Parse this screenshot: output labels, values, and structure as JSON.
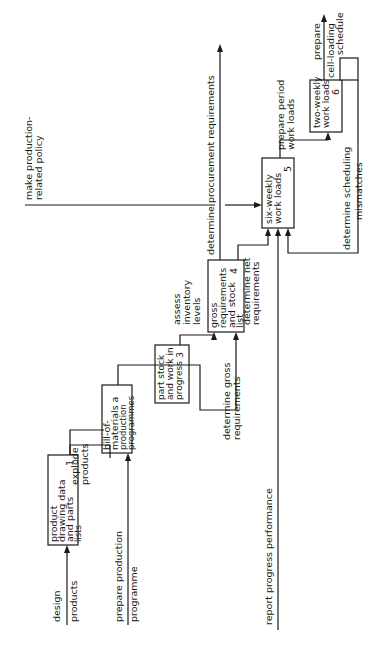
{
  "diagram": {
    "orientation": "rotated-90-ccw",
    "colors": {
      "ink": "#1a1a1a",
      "background": "#ffffff"
    },
    "boxes": [
      {
        "id": 1,
        "lines": [
          "product",
          "drawing data",
          "and parts",
          "lists"
        ],
        "number": "1"
      },
      {
        "id": 2,
        "lines": [
          "bill-of-",
          "materials a",
          "production",
          "programmes"
        ],
        "number": "2"
      },
      {
        "id": 3,
        "lines": [
          "part stock",
          "and work in",
          "progress"
        ],
        "number": "3"
      },
      {
        "id": 4,
        "lines": [
          "gross",
          "requirements",
          "and stock",
          "list"
        ],
        "number": "4"
      },
      {
        "id": 5,
        "lines": [
          "six-weekly",
          "work loads"
        ],
        "number": "5"
      },
      {
        "id": 6,
        "lines": [
          "two-weekly",
          "work loads"
        ],
        "number": "6"
      }
    ],
    "labels": {
      "design_products": [
        "design",
        "products"
      ],
      "explode_products": [
        "explode",
        "products"
      ],
      "prepare_production_programme": [
        "prepare production",
        "programme"
      ],
      "assess_inventory_levels": [
        "assess",
        "inventory",
        "levels"
      ],
      "determine_gross_requirements": [
        "determine gross",
        "requirements"
      ],
      "determine_net_requirements": [
        "determine net",
        "requirements"
      ],
      "make_policy": [
        "make production-",
        "related policy"
      ],
      "determine_procurement": [
        "determine procurement requirements"
      ],
      "prepare_period_work_loads": [
        "prepare period",
        "work loads"
      ],
      "determine_scheduling_mismatches": [
        "determine scheduling",
        "mismatches"
      ],
      "prepare_cell_loading": [
        "prepare",
        "cell-loading",
        "schedule"
      ],
      "report_progress": [
        "report  progress performance"
      ]
    }
  }
}
